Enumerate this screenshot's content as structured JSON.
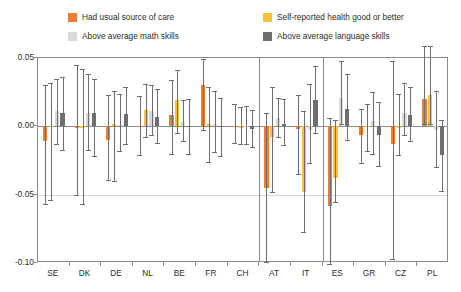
{
  "legend": {
    "items": [
      {
        "label": "Had usual source of care",
        "color": "#F07C30",
        "key": "usual_care"
      },
      {
        "label": "Self-reported health good or better",
        "color": "#F5C23E",
        "key": "self_health"
      },
      {
        "label": "Above average math skills",
        "color": "#D9D9D9",
        "key": "math"
      },
      {
        "label": "Above average language skills",
        "color": "#6E6E6E",
        "key": "language"
      }
    ]
  },
  "chart_data": {
    "type": "bar",
    "title": "",
    "xlabel": "",
    "ylabel": "",
    "ylim": [
      -0.1,
      0.05
    ],
    "yticks": [
      "0.05",
      "0.00",
      "-0.05",
      "-0.10"
    ],
    "ytick_values": [
      0.05,
      0.0,
      -0.05,
      -0.1
    ],
    "grid": true,
    "legend_position": "top",
    "error_bars": true,
    "group_separators_after": [
      "CH",
      "IT"
    ],
    "categories": [
      "SE",
      "DK",
      "DE",
      "NL",
      "BE",
      "FR",
      "CH",
      "AT",
      "IT",
      "ES",
      "GR",
      "CZ",
      "PL"
    ],
    "series": [
      {
        "name": "Had usual source of care",
        "color": "#F07C30",
        "values": [
          -0.011,
          -0.001,
          -0.01,
          0.0,
          0.008,
          0.03,
          0.0,
          -0.045,
          -0.002,
          -0.058,
          -0.006,
          -0.013,
          0.02
        ],
        "err_low": [
          -0.057,
          -0.05,
          -0.039,
          -0.021,
          -0.02,
          -0.003,
          -0.012,
          -0.099,
          -0.035,
          -0.101,
          -0.027,
          -0.097,
          0.002
        ],
        "err_high": [
          0.03,
          0.045,
          0.023,
          0.022,
          0.034,
          0.049,
          0.016,
          0.01,
          0.023,
          0.006,
          0.013,
          0.048,
          0.059
        ]
      },
      {
        "name": "Self-reported health good or better",
        "color": "#F5C23E",
        "values": [
          0.0,
          -0.001,
          0.002,
          0.012,
          0.019,
          0.002,
          -0.001,
          -0.008,
          -0.048,
          -0.038,
          0.0,
          -0.001,
          0.023
        ],
        "err_low": [
          -0.054,
          -0.057,
          -0.04,
          -0.008,
          -0.005,
          -0.026,
          -0.013,
          -0.048,
          -0.077,
          -0.055,
          -0.018,
          -0.021,
          0.002
        ],
        "err_high": [
          0.032,
          0.042,
          0.026,
          0.031,
          0.041,
          0.029,
          0.014,
          0.029,
          0.011,
          0.005,
          0.016,
          0.024,
          0.059
        ]
      },
      {
        "name": "Above average math skills",
        "color": "#D9D9D9",
        "values": [
          0.011,
          0.01,
          0.001,
          0.011,
          0.003,
          0.002,
          0.0,
          0.006,
          -0.003,
          0.021,
          0.004,
          0.01,
          -0.003
        ],
        "err_low": [
          -0.013,
          -0.017,
          -0.018,
          -0.006,
          -0.011,
          -0.019,
          -0.013,
          -0.008,
          -0.027,
          0.002,
          -0.02,
          -0.006,
          -0.03
        ],
        "err_high": [
          0.035,
          0.038,
          0.024,
          0.03,
          0.019,
          0.026,
          0.015,
          0.021,
          0.031,
          0.048,
          0.025,
          0.032,
          0.026
        ]
      },
      {
        "name": "Above average language skills",
        "color": "#6E6E6E",
        "values": [
          0.01,
          0.01,
          0.009,
          0.007,
          0.0,
          0.0,
          -0.002,
          0.002,
          0.019,
          0.013,
          -0.006,
          0.008,
          -0.021
        ],
        "err_low": [
          -0.017,
          -0.022,
          -0.013,
          -0.012,
          -0.02,
          -0.022,
          -0.015,
          -0.014,
          -0.005,
          -0.01,
          -0.029,
          -0.011,
          -0.047
        ],
        "err_high": [
          0.036,
          0.035,
          0.029,
          0.027,
          0.02,
          0.021,
          0.012,
          0.02,
          0.044,
          0.038,
          0.018,
          0.029,
          0.005
        ]
      }
    ]
  }
}
